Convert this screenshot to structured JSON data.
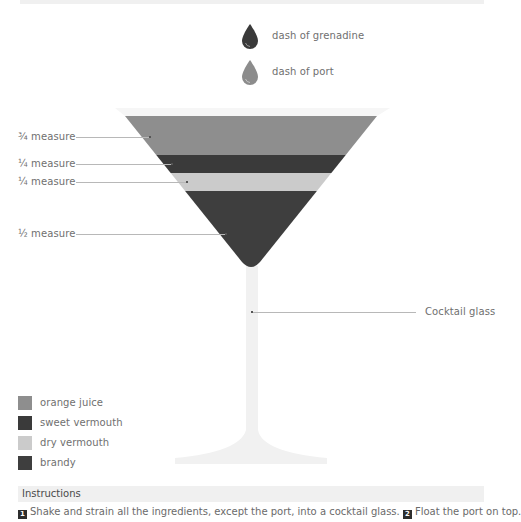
{
  "garnish": [
    {
      "label": "dash of grenadine",
      "color": "#3a3a3a",
      "icon": "drop-icon"
    },
    {
      "label": "dash of port",
      "color": "#8c8c8c",
      "icon": "drop-icon"
    }
  ],
  "layers": [
    {
      "label": "¾ measure",
      "ingredient": "orange juice",
      "color": "#8e8e8e"
    },
    {
      "label": "¼ measure",
      "ingredient": "sweet vermouth",
      "color": "#3a3a3a"
    },
    {
      "label": "¼ measure",
      "ingredient": "dry vermouth",
      "color": "#cbcbcb"
    },
    {
      "label": "½ measure",
      "ingredient": "brandy",
      "color": "#3e3e3e"
    }
  ],
  "glass": {
    "label": "Cocktail glass",
    "color": "#f3f3f3"
  },
  "legend": [
    {
      "label": "orange juice",
      "color": "#8e8e8e"
    },
    {
      "label": "sweet vermouth",
      "color": "#3a3a3a"
    },
    {
      "label": "dry vermouth",
      "color": "#cbcbcb"
    },
    {
      "label": "brandy",
      "color": "#3e3e3e"
    }
  ],
  "instructions": {
    "title": "Instructions",
    "steps": [
      {
        "num": "1",
        "text": "Shake and strain all the ingredients, except the port, into a cocktail glass."
      },
      {
        "num": "2",
        "text": "Float the port on top."
      }
    ]
  }
}
